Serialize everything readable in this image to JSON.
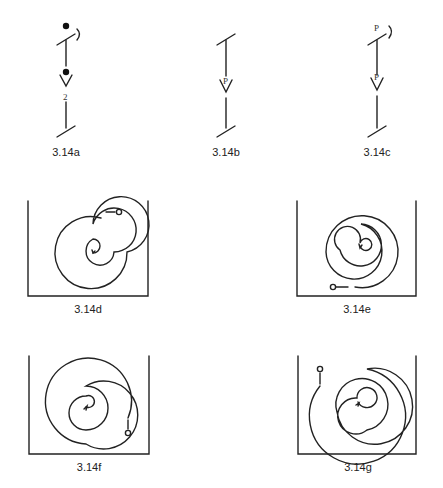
{
  "figures": [
    {
      "id": "3.14a",
      "label": "3.14a",
      "annotations": [
        "2"
      ]
    },
    {
      "id": "3.14b",
      "label": "3.14b",
      "annotations": [
        "P"
      ]
    },
    {
      "id": "3.14c",
      "label": "3.14c",
      "annotations": [
        "P",
        "P"
      ]
    },
    {
      "id": "3.14d",
      "label": "3.14d"
    },
    {
      "id": "3.14e",
      "label": "3.14e"
    },
    {
      "id": "3.14f",
      "label": "3.14f"
    },
    {
      "id": "3.14g",
      "label": "3.14g"
    }
  ]
}
